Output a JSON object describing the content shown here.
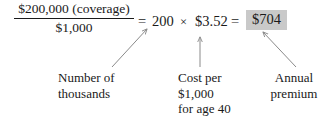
{
  "figure": {
    "background_color": "#ffffff",
    "text_color": "#1a1a1a",
    "highlight_color": "#c9c9c9"
  },
  "equation": {
    "fraction": {
      "numerator": "$200,000 (coverage)",
      "denominator": "$1,000"
    },
    "equals_1": "=",
    "factor": "200",
    "times": "×",
    "rate": "$3.52",
    "equals_2": "=",
    "result": "$704"
  },
  "annotations": [
    {
      "id": "number-of-thousands",
      "lines": [
        "Number of",
        "thousands"
      ],
      "points_to": "factor"
    },
    {
      "id": "cost-per-thousand",
      "lines": [
        "Cost per",
        "$1,000",
        "for age 40"
      ],
      "points_to": "rate"
    },
    {
      "id": "annual-premium",
      "lines": [
        "Annual",
        "premium"
      ],
      "points_to": "result"
    }
  ],
  "arrows": {
    "color": "#8a8a8a",
    "left": {
      "from_x": 112,
      "from_y": 67,
      "to_x": 147,
      "to_y": 29
    },
    "middle": {
      "from_x": 200,
      "from_y": 67,
      "to_x": 200,
      "to_y": 37
    },
    "right": {
      "from_x": 296,
      "from_y": 67,
      "to_x": 263,
      "to_y": 32
    }
  }
}
